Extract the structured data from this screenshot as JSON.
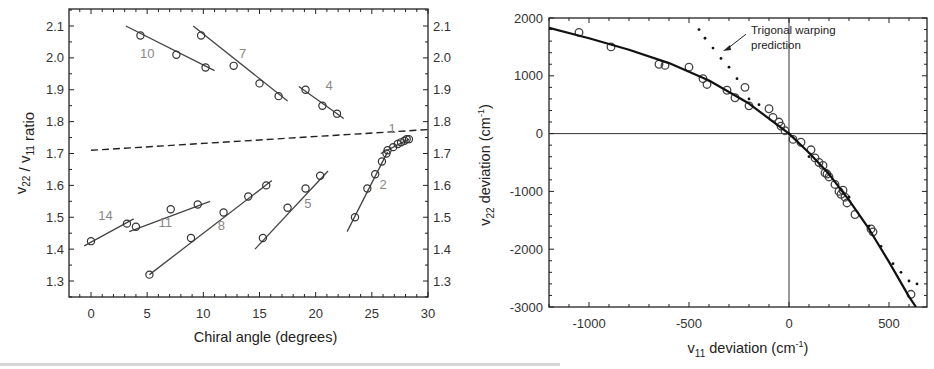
{
  "chart_data": [
    {
      "type": "scatter",
      "title": "",
      "xlabel": "Chiral angle  (degrees)",
      "ylabel": "ν22 / ν11 ratio",
      "ylabel_parts": {
        "nu_a": "v",
        "sub_a": "22",
        "sep": " / ",
        "nu_b": "v",
        "sub_b": "11",
        "rest": " ratio"
      },
      "xlim": [
        -2,
        30
      ],
      "ylim": [
        1.25,
        2.15
      ],
      "x_ticks": [
        0,
        5,
        10,
        15,
        20,
        25,
        30
      ],
      "y_ticks": [
        1.3,
        1.4,
        1.5,
        1.6,
        1.7,
        1.8,
        1.9,
        2.0,
        2.1
      ],
      "y_ticks_right": [
        1.3,
        1.4,
        1.5,
        1.6,
        1.7,
        1.8,
        1.9,
        2.0,
        2.1
      ],
      "grid": false,
      "reference_line": {
        "style": "dashed",
        "x": [
          0,
          30
        ],
        "y": [
          1.71,
          1.775
        ]
      },
      "series": [
        {
          "name": "10",
          "x": [
            4.4,
            7.6,
            10.2
          ],
          "y": [
            2.07,
            2.01,
            1.97
          ],
          "fit": {
            "x": [
              3.1,
              11.0
            ],
            "y": [
              2.1,
              1.96
            ]
          },
          "label_pos": [
            5.0,
            2.0
          ]
        },
        {
          "name": "7",
          "x": [
            9.8,
            12.7,
            15.0,
            16.7
          ],
          "y": [
            2.07,
            1.975,
            1.92,
            1.88
          ],
          "fit": {
            "x": [
              9.1,
              17.5
            ],
            "y": [
              2.1,
              1.865
            ]
          },
          "label_pos": [
            13.5,
            2.0
          ]
        },
        {
          "name": "4",
          "x": [
            19.1,
            20.6,
            21.9
          ],
          "y": [
            1.9,
            1.85,
            1.825
          ],
          "fit": {
            "x": [
              18.5,
              22.5
            ],
            "y": [
              1.91,
              1.81
            ]
          },
          "label_pos": [
            21.2,
            1.9
          ]
        },
        {
          "name": "14",
          "x": [
            0.0,
            3.2
          ],
          "y": [
            1.425,
            1.48
          ],
          "fit": {
            "x": [
              -0.6,
              3.8
            ],
            "y": [
              1.41,
              1.495
            ]
          },
          "label_pos": [
            1.3,
            1.49
          ]
        },
        {
          "name": "11",
          "x": [
            4.0,
            7.1,
            9.5
          ],
          "y": [
            1.47,
            1.525,
            1.54
          ],
          "fit": {
            "x": [
              3.4,
              10.6
            ],
            "y": [
              1.455,
              1.55
            ]
          },
          "label_pos": [
            6.6,
            1.47
          ]
        },
        {
          "name": "8",
          "x": [
            5.2,
            8.9,
            11.8,
            14.0,
            15.6
          ],
          "y": [
            1.32,
            1.435,
            1.515,
            1.565,
            1.6
          ],
          "fit": {
            "x": [
              5.2,
              16.1
            ],
            "y": [
              1.32,
              1.615
            ]
          },
          "label_pos": [
            11.6,
            1.46
          ]
        },
        {
          "name": "5",
          "x": [
            15.3,
            17.5,
            19.1,
            20.4
          ],
          "y": [
            1.435,
            1.53,
            1.59,
            1.63
          ],
          "fit": {
            "x": [
              14.6,
              21.1
            ],
            "y": [
              1.4,
              1.645
            ]
          },
          "label_pos": [
            19.3,
            1.53
          ]
        },
        {
          "name": "2",
          "x": [
            23.5,
            24.6,
            25.3,
            25.9,
            26.3
          ],
          "y": [
            1.5,
            1.59,
            1.635,
            1.675,
            1.7
          ],
          "fit": {
            "x": [
              22.8,
              26.4
            ],
            "y": [
              1.455,
              1.705
            ]
          },
          "label_pos": [
            26.0,
            1.59
          ]
        },
        {
          "name": "1",
          "x": [
            26.4,
            26.9,
            27.3,
            27.6,
            27.9,
            28.1,
            28.3
          ],
          "y": [
            1.71,
            1.72,
            1.73,
            1.735,
            1.74,
            1.745,
            1.745
          ],
          "fit": {
            "x": [
              25.8,
              28.3
            ],
            "y": [
              1.7,
              1.745
            ]
          },
          "label_pos": [
            26.8,
            1.765
          ]
        }
      ]
    },
    {
      "type": "scatter",
      "title": "",
      "xlabel": "ν11 deviation  (cm⁻¹)",
      "xlabel_parts": {
        "nu": "v",
        "sub": "11",
        "rest": " deviation  (cm",
        "sup": "-1",
        "close": ")"
      },
      "ylabel": "ν22 deviation  (cm⁻¹)",
      "ylabel_parts": {
        "nu": "v",
        "sub": "22",
        "rest": " deviation  (cm",
        "sup": "-1",
        "close": ")"
      },
      "xlim": [
        -1200,
        690
      ],
      "ylim": [
        -3000,
        2000
      ],
      "x_ticks": [
        -1000,
        -500,
        0,
        500
      ],
      "y_ticks": [
        -3000,
        -2000,
        -1000,
        0,
        1000,
        2000
      ],
      "grid": false,
      "zero_lines": true,
      "annotation": {
        "text_line1": "Trigonal warping",
        "text_line2": "prediction",
        "arrow_to": [
          -340,
          1430
        ],
        "text_at": [
          -190,
          1650
        ]
      },
      "series": [
        {
          "name": "data",
          "style": "open-circles",
          "x": [
            -1050,
            -890,
            -650,
            -620,
            -500,
            -430,
            -410,
            -310,
            -270,
            -220,
            -200,
            -100,
            -80,
            -50,
            -40,
            -20,
            20,
            60,
            110,
            130,
            150,
            170,
            180,
            190,
            200,
            230,
            250,
            260,
            270,
            280,
            290,
            330,
            410,
            420,
            610
          ],
          "y": [
            1750,
            1500,
            1200,
            1180,
            1150,
            950,
            850,
            750,
            620,
            800,
            480,
            430,
            280,
            200,
            130,
            50,
            -100,
            -150,
            -280,
            -420,
            -500,
            -550,
            -680,
            -700,
            -750,
            -880,
            -1000,
            -1050,
            -980,
            -1100,
            -1200,
            -1400,
            -1650,
            -1700,
            -2780
          ]
        },
        {
          "name": "fit",
          "style": "solid",
          "x": [
            -1200,
            -1000,
            -800,
            -600,
            -400,
            -200,
            0,
            100,
            200,
            300,
            400,
            500,
            600,
            635
          ],
          "y": [
            1830,
            1650,
            1450,
            1220,
            920,
            520,
            0,
            -330,
            -700,
            -1150,
            -1650,
            -2220,
            -2820,
            -3000
          ]
        },
        {
          "name": "Trigonal warping prediction",
          "style": "dotted",
          "x": [
            -450,
            -420,
            -380,
            -340,
            -300,
            -260,
            -200,
            -150,
            0,
            100,
            200,
            300,
            400,
            460,
            520,
            560,
            600,
            640
          ],
          "y": [
            1800,
            1650,
            1480,
            1300,
            1150,
            950,
            600,
            500,
            0,
            -400,
            -700,
            -1100,
            -1600,
            -1950,
            -2250,
            -2400,
            -2550,
            -2600
          ]
        }
      ]
    }
  ]
}
